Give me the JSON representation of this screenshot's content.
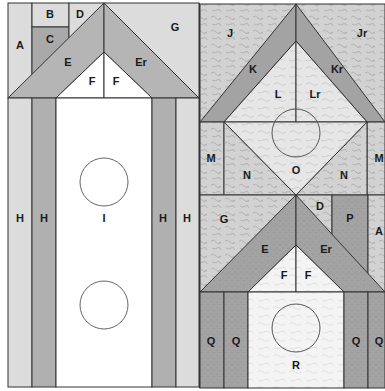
{
  "diagram": {
    "colors": {
      "light": "#dcdcdc",
      "medium": "#b5b5b5",
      "dark": "#9a9a9a",
      "white": "#ffffff",
      "print_light": "#cfcfcf",
      "print_mid": "#a8a8a8",
      "print_dark": "#8f8f8f",
      "outline": "#333333"
    },
    "left_block": {
      "labels": {
        "A": "A",
        "B": "B",
        "C": "C",
        "D": "D",
        "G": "G",
        "E": "E",
        "Er": "Er",
        "F1": "F",
        "F2": "F",
        "H1": "H",
        "H2": "H",
        "I": "I",
        "H3": "H",
        "H4": "H"
      }
    },
    "right_top_block": {
      "labels": {
        "J": "J",
        "Jr": "Jr",
        "K": "K",
        "Kr": "Kr",
        "L": "L",
        "Lr": "Lr",
        "M1": "M",
        "M2": "M",
        "N1": "N",
        "N2": "N",
        "O": "O"
      }
    },
    "right_bottom_block": {
      "labels": {
        "G": "G",
        "D": "D",
        "P": "P",
        "A": "A",
        "E": "E",
        "Er": "Er",
        "F1": "F",
        "F2": "F",
        "Q1": "Q",
        "Q2": "Q",
        "R": "R",
        "Q3": "Q",
        "Q4": "Q"
      }
    }
  }
}
